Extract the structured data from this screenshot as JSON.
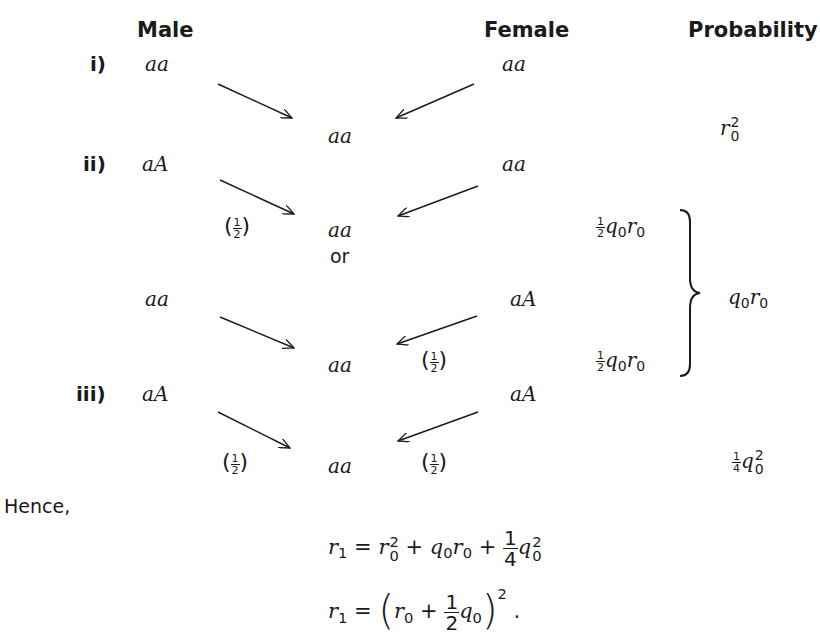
{
  "headers": {
    "male": "Male",
    "female": "Female",
    "probability": "Probability"
  },
  "cases": [
    {
      "label": "i)",
      "male": "aa",
      "female": "aa",
      "offspring": "aa",
      "probability": "r0^2"
    },
    {
      "label": "ii)",
      "male": "aA",
      "female": "aa",
      "offspring": "aa",
      "male_factor": "(1/2)",
      "partial_probability": "1/2 q0 r0",
      "connector": "or",
      "alt": {
        "male": "aa",
        "female": "aA",
        "offspring": "aa",
        "female_factor": "(1/2)",
        "partial_probability": "1/2 q0 r0"
      },
      "probability": "q0 r0"
    },
    {
      "label": "iii)",
      "male": "aA",
      "female": "aA",
      "offspring": "aa",
      "male_factor": "(1/2)",
      "female_factor": "(1/2)",
      "probability": "1/4 q0^2"
    }
  ],
  "text": {
    "or": "or",
    "hence": "Hence,",
    "half_num": "1",
    "half_den": "2",
    "quarter_num": "1",
    "quarter_den": "4",
    "eq1": "r1 = r0^2 + q0 r0 + 1/4 q0^2",
    "eq2": "r1 = (r0 + 1/2 q0)^2 ."
  },
  "symbols": {
    "r": "r",
    "q": "q",
    "zero": "0",
    "one": "1",
    "two": "2",
    "eq": "=",
    "plus": "+",
    "lparen": "(",
    "rparen": ")",
    "period": ".",
    "open_p": "(",
    "close_p": ")"
  }
}
